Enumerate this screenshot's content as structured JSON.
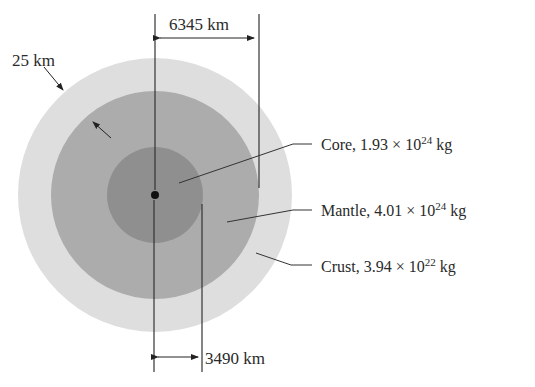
{
  "diagram": {
    "layers": [
      {
        "name": "Core",
        "mass_mantissa": "1.93",
        "mass_exponent": "24",
        "unit": "kg",
        "color": "#8e8e8e"
      },
      {
        "name": "Mantle",
        "mass_mantissa": "4.01",
        "mass_exponent": "24",
        "unit": "kg",
        "color": "#ababab"
      },
      {
        "name": "Crust",
        "mass_mantissa": "3.94",
        "mass_exponent": "22",
        "unit": "kg",
        "color": "#dcdcdc"
      }
    ],
    "dimensions": {
      "outer_radius": "6345 km",
      "core_radius": "3490 km",
      "crust_thickness": "25 km"
    },
    "labels": {
      "core_prefix": "Core, 1.93 × 10",
      "core_exp": "24",
      "core_unit": " kg",
      "mantle_prefix": "Mantle, 4.01 × 10",
      "mantle_exp": "24",
      "mantle_unit": " kg",
      "crust_prefix": "Crust, 3.94 × 10",
      "crust_exp": "22",
      "crust_unit": " kg"
    }
  }
}
